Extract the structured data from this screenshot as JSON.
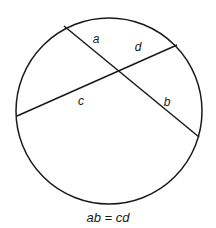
{
  "diagram": {
    "circle": {
      "cx": 109,
      "cy": 111,
      "r": 93,
      "stroke": "#1a1a1a"
    },
    "chords": [
      {
        "name": "chord-ab",
        "x1": 64,
        "y1": 26,
        "x2": 199,
        "y2": 137
      },
      {
        "name": "chord-cd",
        "x1": 17,
        "y1": 116,
        "x2": 177,
        "y2": 45
      }
    ],
    "intersection": {
      "x": 117,
      "y": 70
    },
    "labels": [
      {
        "text": "a",
        "x": 96,
        "y": 43
      },
      {
        "text": "d",
        "x": 138,
        "y": 51
      },
      {
        "text": "c",
        "x": 81,
        "y": 105
      },
      {
        "text": "b",
        "x": 167,
        "y": 106
      }
    ],
    "caption": {
      "text": "ab = cd",
      "x": 108,
      "y": 222
    }
  }
}
